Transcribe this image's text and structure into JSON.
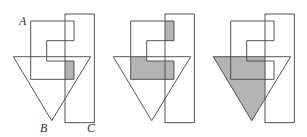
{
  "figure": {
    "labels": {
      "a": "A",
      "b": "B",
      "c": "C"
    },
    "colors": {
      "stroke": "#444444",
      "shade": "#b4b4b4",
      "background": "#ffffff"
    },
    "panels": [
      {
        "id": 1,
        "shaded_region": "A ∩ B ∩ C"
      },
      {
        "id": 2,
        "shaded_region": "A ∩ (B ∪ C)"
      },
      {
        "id": 3,
        "shaded_region": "B minus C"
      }
    ]
  }
}
